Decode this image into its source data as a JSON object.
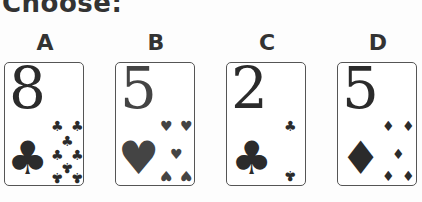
{
  "title": "Choose:",
  "options": [
    {
      "label": "A",
      "rank": "8",
      "suit": "clubs",
      "suit_glyph": "♣"
    },
    {
      "label": "B",
      "rank": "5",
      "suit": "hearts",
      "suit_glyph": "♥"
    },
    {
      "label": "C",
      "rank": "2",
      "suit": "clubs",
      "suit_glyph": "♣"
    },
    {
      "label": "D",
      "rank": "5",
      "suit": "diamonds",
      "suit_glyph": "♦"
    }
  ]
}
